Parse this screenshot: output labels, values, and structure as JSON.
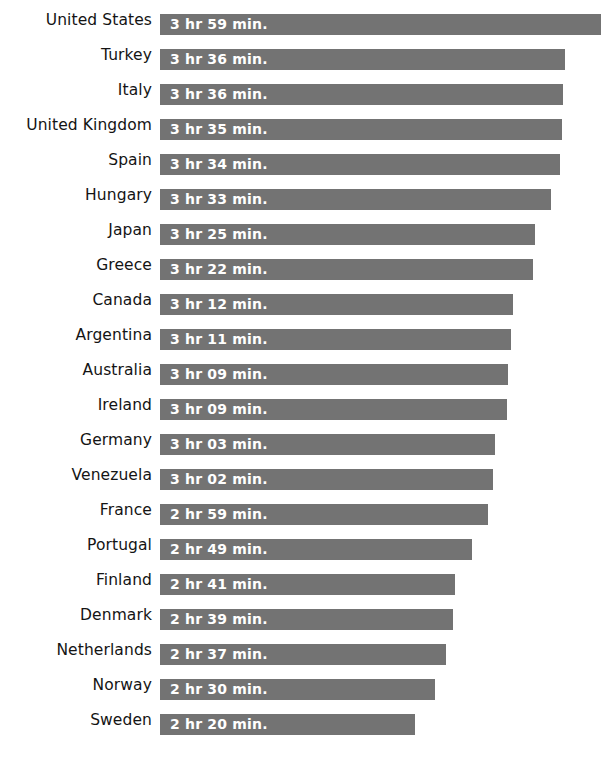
{
  "chart_data": {
    "type": "bar",
    "orientation": "horizontal",
    "title": "",
    "subtitle": "",
    "xlabel": "",
    "ylabel": "",
    "grid": false,
    "legend": null,
    "axis_visible": false,
    "xlim": [
      0,
      239
    ],
    "value_unit": "minutes per day",
    "bar_color": "#737373",
    "value_label_color": "#ffffff",
    "category_label_color": "#141414",
    "background_color": "#ffffff",
    "categories": [
      "United States",
      "Turkey",
      "Italy",
      "United Kingdom",
      "Spain",
      "Hungary",
      "Japan",
      "Greece",
      "Canada",
      "Argentina",
      "Australia",
      "Ireland",
      "Germany",
      "Venezuela",
      "France",
      "Portugal",
      "Finland",
      "Denmark",
      "Netherlands",
      "Norway",
      "Sweden"
    ],
    "values": [
      239,
      216,
      216,
      215,
      214,
      213,
      205,
      202,
      192,
      191,
      189,
      189,
      183,
      182,
      179,
      169,
      161,
      159,
      157,
      150,
      140
    ],
    "value_labels": [
      "3 hr 59 min.",
      "3 hr 36 min.",
      "3 hr 36 min.",
      "3 hr 35 min.",
      "3 hr 34 min.",
      "3 hr 33 min.",
      "3 hr 25 min.",
      "3 hr 22 min.",
      "3 hr 12 min.",
      "3 hr 11 min.",
      "3 hr 09 min.",
      "3 hr 09 min.",
      "3 hr 03 min.",
      "3 hr 02 min.",
      "2 hr 59 min.",
      "2 hr 49 min.",
      "2 hr 41 min.",
      "2 hr 39 min.",
      "2 hr 37 min.",
      "2 hr 30 min.",
      "2 hr 20 min."
    ],
    "bar_pixel_widths": [
      441,
      405,
      403,
      402,
      400,
      391,
      375,
      373,
      353,
      351,
      348,
      347,
      335,
      333,
      328,
      312,
      295,
      293,
      286,
      275,
      255
    ]
  }
}
